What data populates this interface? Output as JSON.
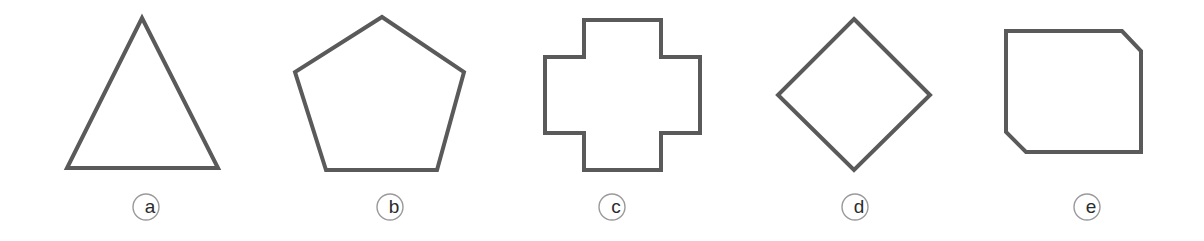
{
  "figure": {
    "background_color": "#ffffff",
    "stroke_color": "#5a5a5a",
    "stroke_width": 4,
    "label_circle_stroke_color": "#9a9a9a",
    "label_text_color": "#2b2b2b",
    "width": 1204,
    "height": 241
  },
  "shapes": [
    {
      "id": "shape-a",
      "label": "a",
      "name": "triangle",
      "sides": 3,
      "points": "142,18 218,168 67,168",
      "label_cx": 146,
      "label_cy": 207,
      "label_r": 13
    },
    {
      "id": "shape-b",
      "label": "b",
      "name": "pentagon",
      "sides": 5,
      "points": "382,17 464,72 437,170 326,170 295,72",
      "label_cx": 390,
      "label_cy": 207,
      "label_r": 13
    },
    {
      "id": "shape-c",
      "label": "c",
      "name": "cross",
      "sides": 12,
      "points": "584,20 661,20 661,57 700,57 700,133 661,133 661,170 584,170 584,133 545,133 545,57 584,57",
      "label_cx": 612,
      "label_cy": 207,
      "label_r": 13
    },
    {
      "id": "shape-d",
      "label": "d",
      "name": "diamond",
      "sides": 4,
      "points": "854,19 930,95 854,170 778,95",
      "label_cx": 855,
      "label_cy": 207,
      "label_r": 13
    },
    {
      "id": "shape-e",
      "label": "e",
      "name": "chamfered-rectangle",
      "sides": 6,
      "points": "1006,31 1122,31 1141,51 1141,152 1026,152 1006,132",
      "label_cx": 1087,
      "label_cy": 207,
      "label_r": 13
    }
  ]
}
